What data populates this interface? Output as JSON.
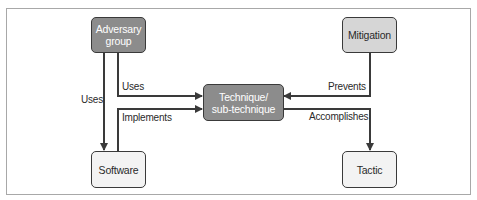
{
  "diagram": {
    "nodes": {
      "adversary_group": {
        "label": "Adversary\ngroup",
        "fill": "#8c8c8c"
      },
      "mitigation": {
        "label": "Mitigation",
        "fill": "#d6d6d6"
      },
      "technique": {
        "label": "Technique/\nsub-technique",
        "fill": "#8c8c8c"
      },
      "software": {
        "label": "Software",
        "fill": "#f3f3f3"
      },
      "tactic": {
        "label": "Tactic",
        "fill": "#f3f3f3"
      }
    },
    "edges": {
      "adversary_uses_software": {
        "from": "Adversary group",
        "to": "Software",
        "label": "Uses"
      },
      "adversary_uses_technique": {
        "from": "Adversary group",
        "to": "Technique/sub-technique",
        "label": "Uses"
      },
      "software_implements_technique": {
        "from": "Software",
        "to": "Technique/sub-technique",
        "label": "Implements"
      },
      "mitigation_prevents_technique": {
        "from": "Mitigation",
        "to": "Technique/sub-technique",
        "label": "Prevents"
      },
      "technique_accomplishes_tactic": {
        "from": "Technique/sub-technique",
        "to": "Tactic",
        "label": "Accomplishes"
      }
    },
    "colors": {
      "line": "#3a3a3a",
      "frame": "#a8a8a8"
    }
  }
}
